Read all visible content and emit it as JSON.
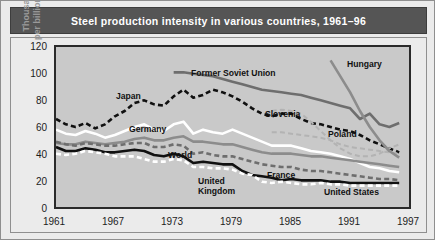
{
  "title": "Steel production intensity in various countries, 1961–96",
  "figure": {
    "ylabel": "Thousands of tonnes\nper billion dollars of GDP",
    "yticks": [
      "120",
      "100",
      "80",
      "60",
      "40",
      "20",
      "0"
    ],
    "xticks": [
      "1961",
      "1967",
      "1973",
      "1979",
      "1985",
      "1991",
      "1997"
    ]
  },
  "series_labels": {
    "japan": "Japan",
    "germany": "Germany",
    "world": "World",
    "former_soviet_union": "Former Soviet Union",
    "slovenia": "Slovenia",
    "poland": "Poland",
    "hungary": "Hungary",
    "united_kingdom": "United\nKingdom",
    "france": "France",
    "united_states": "United States"
  },
  "colors": {
    "title_bar": "#555555",
    "page_background": "#ebebeb",
    "plot_background": "#c9c9c9",
    "axis": "#2a2a2a",
    "black": "#101010",
    "white": "#ffffff",
    "dark_gray": "#6e6e6e",
    "mid_gray": "#8c8c8c",
    "light_gray": "#b3b3b3",
    "axis_text": "#1c1c1c",
    "ylabel_text": "#9a9a9a"
  },
  "chart_data": {
    "type": "line",
    "title": "Steel production intensity in various countries, 1961–96",
    "xlabel": "",
    "ylabel": "Thousands of tonnes per billion dollars of GDP",
    "xlim": [
      1961,
      1997
    ],
    "ylim": [
      0,
      120
    ],
    "yticks": [
      0,
      20,
      40,
      60,
      80,
      100,
      120
    ],
    "xticks": [
      1961,
      1967,
      1973,
      1979,
      1985,
      1991,
      1997
    ],
    "grid": false,
    "legend": "inline-labels",
    "series": [
      {
        "name": "Japan",
        "style": "dashed",
        "color": "#101010",
        "x": [
          1961,
          1962,
          1963,
          1964,
          1965,
          1966,
          1967,
          1968,
          1969,
          1970,
          1971,
          1972,
          1973,
          1974,
          1975,
          1976,
          1977,
          1978,
          1979,
          1980,
          1981,
          1982,
          1983,
          1984,
          1985,
          1986,
          1987,
          1988,
          1989,
          1990,
          1991,
          1992,
          1993,
          1994,
          1995,
          1996
        ],
        "y": [
          66,
          62,
          60,
          63,
          59,
          62,
          68,
          72,
          78,
          80,
          77,
          76,
          83,
          88,
          82,
          84,
          88,
          86,
          83,
          79,
          74,
          70,
          68,
          70,
          70,
          66,
          63,
          62,
          60,
          58,
          57,
          54,
          50,
          47,
          44,
          41
        ]
      },
      {
        "name": "Germany",
        "style": "solid",
        "color": "#ffffff",
        "x": [
          1961,
          1962,
          1963,
          1964,
          1965,
          1966,
          1967,
          1968,
          1969,
          1970,
          1971,
          1972,
          1973,
          1974,
          1975,
          1976,
          1977,
          1978,
          1979,
          1980,
          1981,
          1982,
          1983,
          1984,
          1985,
          1986,
          1987,
          1988,
          1989,
          1990,
          1991,
          1992,
          1993,
          1994,
          1995,
          1996
        ],
        "y": [
          58,
          55,
          54,
          57,
          55,
          52,
          54,
          57,
          60,
          62,
          58,
          57,
          62,
          64,
          55,
          58,
          56,
          55,
          58,
          55,
          52,
          49,
          46,
          46,
          46,
          44,
          42,
          41,
          40,
          38,
          36,
          33,
          30,
          29,
          27,
          26
        ]
      },
      {
        "name": "World",
        "style": "solid",
        "color": "#8c8c8c",
        "x": [
          1961,
          1962,
          1963,
          1964,
          1965,
          1966,
          1967,
          1968,
          1969,
          1970,
          1971,
          1972,
          1973,
          1974,
          1975,
          1976,
          1977,
          1978,
          1979,
          1980,
          1981,
          1982,
          1983,
          1984,
          1985,
          1986,
          1987,
          1988,
          1989,
          1990,
          1991,
          1992,
          1993,
          1994,
          1995,
          1996
        ],
        "y": [
          48,
          47,
          47,
          49,
          48,
          47,
          48,
          49,
          51,
          52,
          50,
          50,
          52,
          53,
          49,
          49,
          48,
          47,
          47,
          45,
          43,
          41,
          40,
          40,
          40,
          39,
          38,
          38,
          37,
          36,
          35,
          34,
          33,
          32,
          31,
          30
        ]
      },
      {
        "name": "United Kingdom",
        "style": "solid",
        "color": "#101010",
        "x": [
          1961,
          1962,
          1963,
          1964,
          1965,
          1966,
          1967,
          1968,
          1969,
          1970,
          1971,
          1972,
          1973,
          1974,
          1975,
          1976,
          1977,
          1978,
          1979,
          1980,
          1981,
          1982,
          1983,
          1984,
          1985,
          1986,
          1987,
          1988,
          1989,
          1990,
          1991,
          1992,
          1993,
          1994,
          1995,
          1996
        ],
        "y": [
          45,
          42,
          42,
          44,
          43,
          41,
          41,
          42,
          43,
          42,
          39,
          38,
          40,
          38,
          33,
          34,
          33,
          32,
          32,
          27,
          24,
          23,
          22,
          20,
          21,
          20,
          20,
          20,
          19,
          19,
          18,
          18,
          18,
          18,
          18,
          18
        ]
      },
      {
        "name": "United States",
        "style": "dashed",
        "color": "#ffffff",
        "x": [
          1961,
          1962,
          1963,
          1964,
          1965,
          1966,
          1967,
          1968,
          1969,
          1970,
          1971,
          1972,
          1973,
          1974,
          1975,
          1976,
          1977,
          1978,
          1979,
          1980,
          1981,
          1982,
          1983,
          1984,
          1985,
          1986,
          1987,
          1988,
          1989,
          1990,
          1991,
          1992,
          1993,
          1994,
          1995,
          1996
        ],
        "y": [
          40,
          39,
          40,
          42,
          41,
          40,
          38,
          38,
          38,
          36,
          34,
          34,
          36,
          35,
          30,
          30,
          29,
          29,
          28,
          25,
          24,
          19,
          18,
          19,
          18,
          17,
          17,
          18,
          17,
          17,
          16,
          16,
          16,
          16,
          16,
          16
        ]
      },
      {
        "name": "France",
        "style": "dashed",
        "color": "#6e6e6e",
        "x": [
          1961,
          1962,
          1963,
          1964,
          1965,
          1966,
          1967,
          1968,
          1969,
          1970,
          1971,
          1972,
          1973,
          1974,
          1975,
          1976,
          1977,
          1978,
          1979,
          1980,
          1981,
          1982,
          1983,
          1984,
          1985,
          1986,
          1987,
          1988,
          1989,
          1990,
          1991,
          1992,
          1993,
          1994,
          1995,
          1996
        ],
        "y": [
          49,
          47,
          46,
          48,
          47,
          46,
          46,
          47,
          48,
          48,
          45,
          45,
          47,
          46,
          40,
          41,
          39,
          38,
          38,
          36,
          34,
          32,
          31,
          30,
          30,
          28,
          27,
          27,
          26,
          25,
          24,
          23,
          22,
          21,
          21,
          20
        ]
      },
      {
        "name": "Former Soviet Union",
        "style": "solid",
        "color": "#6e6e6e",
        "x": [
          1973,
          1974,
          1975,
          1976,
          1977,
          1978,
          1979,
          1980,
          1981,
          1982,
          1983,
          1984,
          1985,
          1986,
          1987,
          1988,
          1989,
          1990,
          1991,
          1992,
          1993,
          1994,
          1995,
          1996
        ],
        "y": [
          101,
          101,
          100,
          99,
          98,
          96,
          94,
          92,
          90,
          88,
          87,
          86,
          85,
          84,
          82,
          80,
          78,
          76,
          74,
          66,
          70,
          62,
          60,
          63
        ]
      },
      {
        "name": "Slovenia",
        "style": "dashed",
        "color": "#b3b3b3",
        "x": [
          1983,
          1984,
          1985,
          1986,
          1987,
          1988,
          1989,
          1990,
          1991,
          1992,
          1993,
          1994,
          1995,
          1996
        ],
        "y": [
          72,
          73,
          72,
          70,
          64,
          57,
          50,
          44,
          40,
          38,
          38,
          40,
          44,
          47
        ]
      },
      {
        "name": "Poland",
        "style": "dashed",
        "color": "#b3b3b3",
        "x": [
          1983,
          1984,
          1985,
          1986,
          1987,
          1988,
          1989,
          1990,
          1991,
          1992,
          1993,
          1994,
          1995,
          1996
        ],
        "y": [
          56,
          56,
          55,
          54,
          53,
          52,
          50,
          47,
          45,
          44,
          43,
          42,
          41,
          40
        ]
      },
      {
        "name": "Hungary",
        "style": "solid",
        "color": "#8c8c8c",
        "x": [
          1989,
          1990,
          1991,
          1992,
          1993,
          1994,
          1995,
          1996
        ],
        "y": [
          110,
          98,
          86,
          72,
          60,
          50,
          42,
          37
        ]
      }
    ]
  }
}
